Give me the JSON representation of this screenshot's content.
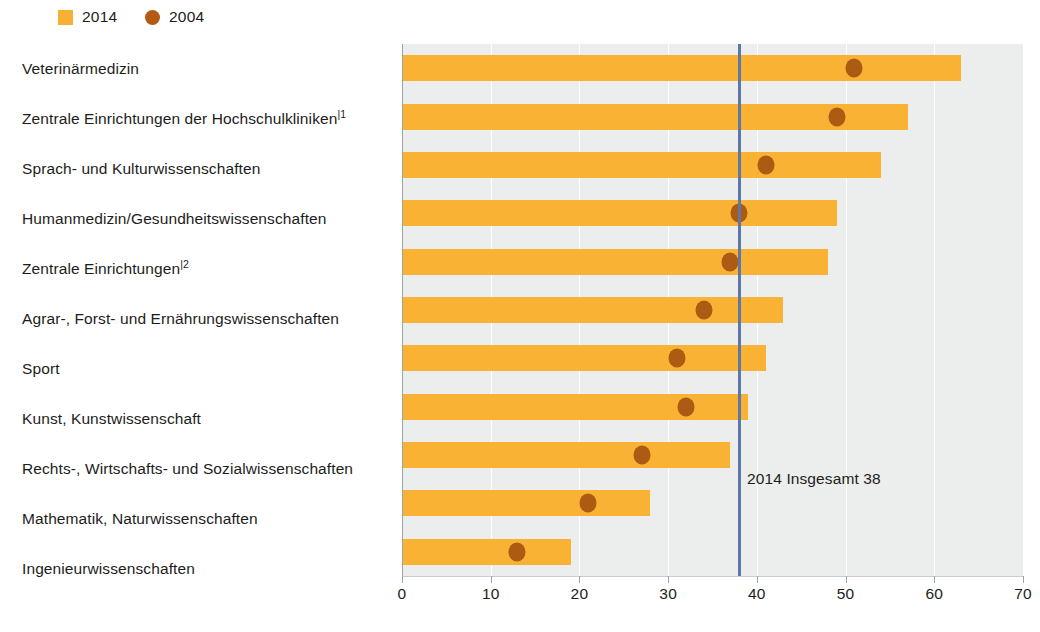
{
  "legend": {
    "items": [
      {
        "label": "2014",
        "marker": "square-swatch-icon",
        "color": "#f9b233"
      },
      {
        "label": "2004",
        "marker": "circle-dot-icon",
        "color": "#ad5a12"
      }
    ]
  },
  "annotation": {
    "reference_label": "2014 Insgesamt 38"
  },
  "axis": {
    "ticks": [
      "0",
      "10",
      "20",
      "30",
      "40",
      "50",
      "60",
      "70"
    ]
  },
  "colors": {
    "bar_2014": "#f9b233",
    "dot_2004": "#ad5a12",
    "reference_line": "#5b78a8",
    "plot_background": "#eceded",
    "gridline": "#ffffff",
    "text": "#1d1d1b"
  },
  "categories": [
    {
      "label": "Veterinärmedizin",
      "footnote": ""
    },
    {
      "label": "Zentrale Einrichtungen der Hochschulkliniken",
      "footnote": "|1"
    },
    {
      "label": "Sprach- und Kulturwissenschaften",
      "footnote": ""
    },
    {
      "label": "Humanmedizin/Gesundheitswissenschaften",
      "footnote": ""
    },
    {
      "label": "Zentrale Einrichtungen",
      "footnote": "|2"
    },
    {
      "label": "Agrar-, Forst- und Ernährungswissenschaften",
      "footnote": ""
    },
    {
      "label": "Sport",
      "footnote": ""
    },
    {
      "label": "Kunst, Kunstwissenschaft",
      "footnote": ""
    },
    {
      "label": "Rechts-, Wirtschafts- und Sozialwissenschaften",
      "footnote": ""
    },
    {
      "label": "Mathematik, Naturwissenschaften",
      "footnote": ""
    },
    {
      "label": "Ingenieurwissenschaften",
      "footnote": ""
    }
  ],
  "chart_data": {
    "type": "bar",
    "orientation": "horizontal",
    "title": "",
    "subtitle": "",
    "xlabel": "",
    "ylabel": "",
    "xlim": [
      0,
      70
    ],
    "xticks": [
      0,
      10,
      20,
      30,
      40,
      50,
      60,
      70
    ],
    "grid": true,
    "legend_position": "top-left",
    "reference_line": {
      "value": 38,
      "label": "2014 Insgesamt 38",
      "color": "#5b78a8"
    },
    "categories": [
      "Veterinärmedizin",
      "Zentrale Einrichtungen der Hochschulkliniken",
      "Sprach- und Kulturwissenschaften",
      "Humanmedizin/Gesundheitswissenschaften",
      "Zentrale Einrichtungen",
      "Agrar-, Forst- und Ernährungswissenschaften",
      "Sport",
      "Kunst, Kunstwissenschaft",
      "Rechts-, Wirtschafts- und Sozialwissenschaften",
      "Mathematik, Naturwissenschaften",
      "Ingenieurwissenschaften"
    ],
    "series": [
      {
        "name": "2014",
        "type": "bar",
        "color": "#f9b233",
        "values": [
          63,
          57,
          54,
          49,
          48,
          43,
          41,
          39,
          37,
          28,
          19
        ]
      },
      {
        "name": "2004",
        "type": "scatter",
        "color": "#ad5a12",
        "values": [
          51,
          49,
          41,
          38,
          37,
          34,
          31,
          32,
          27,
          21,
          13
        ]
      }
    ]
  }
}
